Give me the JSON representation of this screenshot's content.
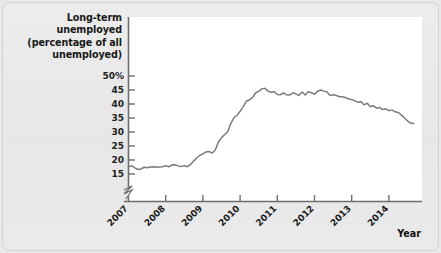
{
  "figure": {
    "background_color": "#e9e9e9",
    "plot_background_color": "#ffffff",
    "line_color": "#7b7b7b",
    "axis_color": "#6e6e6e",
    "text_color": "#1d1d1d"
  },
  "titles": {
    "y_axis_title": "Long-term unemployed\n(percentage of all\nunemployed)",
    "x_axis_title": "Year"
  },
  "chart_data": {
    "type": "line",
    "title": "Long-term unemployed (percentage of all unemployed)",
    "xlabel": "Year",
    "ylabel": "Long-term unemployed (percentage of all unemployed)",
    "xlim": [
      2007.0,
      2014.75
    ],
    "ylim": [
      14.0,
      51.0
    ],
    "ytick_labels": [
      "15",
      "20",
      "25",
      "30",
      "35",
      "40",
      "45",
      "50%"
    ],
    "ytick_values": [
      15,
      20,
      25,
      30,
      35,
      40,
      45,
      50
    ],
    "xtick_labels": [
      "2007",
      "2008",
      "2009",
      "2010",
      "2011",
      "2012",
      "2013",
      "2014"
    ],
    "xtick_values": [
      2007,
      2008,
      2009,
      2010,
      2011,
      2012,
      2013,
      2014
    ],
    "xtick_rotation_deg": 45,
    "grid": false,
    "legend": null,
    "y_axis_break": true,
    "y_axis_break_note": "zigzag break between 0 and 15",
    "series": [
      {
        "name": "Long-term unemployed share",
        "units": "percent of all unemployed",
        "frequency": "monthly",
        "x": [
          2007.0,
          2007.08,
          2007.17,
          2007.25,
          2007.33,
          2007.42,
          2007.5,
          2007.58,
          2007.67,
          2007.75,
          2007.83,
          2007.92,
          2008.0,
          2008.08,
          2008.17,
          2008.25,
          2008.33,
          2008.42,
          2008.5,
          2008.58,
          2008.67,
          2008.75,
          2008.83,
          2008.92,
          2009.0,
          2009.08,
          2009.17,
          2009.25,
          2009.33,
          2009.42,
          2009.5,
          2009.58,
          2009.67,
          2009.75,
          2009.83,
          2009.92,
          2010.0,
          2010.08,
          2010.17,
          2010.25,
          2010.33,
          2010.42,
          2010.5,
          2010.58,
          2010.67,
          2010.75,
          2010.83,
          2010.92,
          2011.0,
          2011.08,
          2011.17,
          2011.25,
          2011.33,
          2011.42,
          2011.5,
          2011.58,
          2011.67,
          2011.75,
          2011.83,
          2011.92,
          2012.0,
          2012.08,
          2012.17,
          2012.25,
          2012.33,
          2012.42,
          2012.5,
          2012.58,
          2012.67,
          2012.75,
          2012.83,
          2012.92,
          2013.0,
          2013.08,
          2013.17,
          2013.25,
          2013.33,
          2013.42,
          2013.5,
          2013.58,
          2013.67,
          2013.75,
          2013.83,
          2013.92,
          2014.0,
          2014.08,
          2014.17,
          2014.25,
          2014.33,
          2014.42,
          2014.5,
          2014.58,
          2014.67
        ],
        "y": [
          17.5,
          18.0,
          17.2,
          16.6,
          16.8,
          17.4,
          17.2,
          17.5,
          17.6,
          17.4,
          17.5,
          17.6,
          18.0,
          17.6,
          18.2,
          18.3,
          17.9,
          17.7,
          18.0,
          17.6,
          18.4,
          19.6,
          20.7,
          21.7,
          22.2,
          22.9,
          23.0,
          22.5,
          23.5,
          26.5,
          28.0,
          29.0,
          30.2,
          33.0,
          35.0,
          36.0,
          37.4,
          39.0,
          41.0,
          41.5,
          42.3,
          44.0,
          44.5,
          45.4,
          45.6,
          44.6,
          44.2,
          44.4,
          43.4,
          43.3,
          44.0,
          43.3,
          43.2,
          44.0,
          43.6,
          43.0,
          44.3,
          43.2,
          44.4,
          44.0,
          43.5,
          44.5,
          45.0,
          44.6,
          44.4,
          43.0,
          43.3,
          43.1,
          42.6,
          42.6,
          42.3,
          41.8,
          41.6,
          41.2,
          40.6,
          40.8,
          39.7,
          40.3,
          39.0,
          39.4,
          38.5,
          38.8,
          38.0,
          38.3,
          37.6,
          37.9,
          37.2,
          37.0,
          36.1,
          35.0,
          34.0,
          33.2,
          33.0
        ]
      }
    ]
  }
}
